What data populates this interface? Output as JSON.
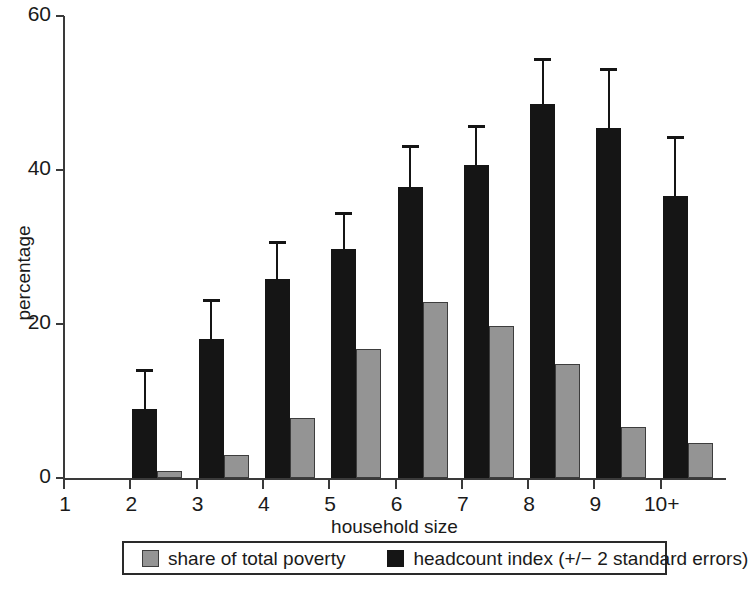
{
  "chart_data": {
    "type": "bar",
    "title": "",
    "xlabel": "household size",
    "ylabel": "percentage",
    "ylim": [
      0,
      60
    ],
    "yticks": [
      0,
      20,
      40,
      60
    ],
    "ytick_labels": [
      "0",
      "20",
      "40",
      "60"
    ],
    "grid": false,
    "categories": [
      "1",
      "2",
      "3",
      "4",
      "5",
      "6",
      "7",
      "8",
      "9",
      "10+"
    ],
    "legend_position": "bottom",
    "series": [
      {
        "name": "share of total poverty",
        "color": "#949494",
        "values": [
          0,
          0.9,
          3.0,
          7.8,
          16.8,
          22.8,
          19.8,
          14.8,
          6.6,
          4.6
        ]
      },
      {
        "name": "headcount index (+/− 2 standard errors)",
        "color": "#151515",
        "values": [
          0,
          8.9,
          18.1,
          25.9,
          29.8,
          37.8,
          40.7,
          48.6,
          45.5,
          36.6
        ],
        "error_upper": [
          0,
          14.1,
          23.2,
          30.8,
          34.5,
          43.2,
          45.9,
          54.5,
          53.3,
          44.4
        ]
      }
    ],
    "legend": [
      {
        "label": "share of total poverty",
        "swatch": "gray"
      },
      {
        "label": "headcount index (+/− 2 standard errors)",
        "swatch": "black"
      }
    ]
  }
}
